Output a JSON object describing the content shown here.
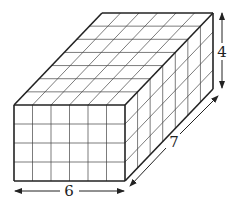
{
  "diagram": {
    "type": "rectangular-prism-unit-cubes",
    "dimensions": {
      "length": 6,
      "depth": 7,
      "height": 4
    },
    "labels": {
      "length": "6",
      "depth": "7",
      "height": "4"
    },
    "colors": {
      "stroke": "#222222",
      "grid": "#444444",
      "background": "#ffffff"
    }
  }
}
